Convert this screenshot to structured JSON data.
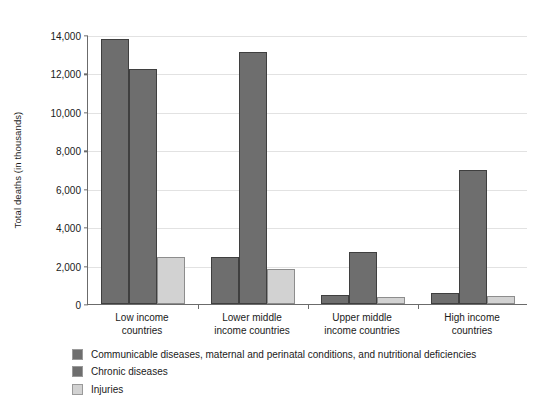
{
  "chart_data": {
    "type": "bar",
    "title": "",
    "xlabel": "",
    "ylabel": "Total deaths (in thousands)",
    "categories": [
      "Low income\ncountries",
      "Lower middle\nincome countries",
      "Upper middle\nincome countries",
      "High income\ncountries"
    ],
    "category_lines": [
      [
        "Low income",
        "countries"
      ],
      [
        "Lower middle",
        "income countries"
      ],
      [
        "Upper middle",
        "income countries"
      ],
      [
        "High income",
        "countries"
      ]
    ],
    "series": [
      {
        "name": "Communicable diseases, maternal and perinatal conditions, and nutritional deficiencies",
        "color": "#6e6e6e",
        "values": [
          13800,
          2450,
          450,
          550
        ]
      },
      {
        "name": "Chronic diseases",
        "color": "#6e6e6e",
        "values": [
          12250,
          13100,
          2700,
          7000
        ]
      },
      {
        "name": "Injuries",
        "color": "#d2d2d2",
        "values": [
          2450,
          1800,
          350,
          400
        ]
      }
    ],
    "ylim": [
      0,
      14000
    ],
    "ytick_values": [
      0,
      2000,
      4000,
      6000,
      8000,
      10000,
      12000,
      14000
    ],
    "ytick_labels": [
      "0",
      "2,000",
      "4,000",
      "6,000",
      "8,000",
      "10,000",
      "12,000",
      "14,000"
    ],
    "grid": true,
    "legend_position": "bottom-left",
    "background_color": "#ffffff",
    "axis_color": "#6b6b6b",
    "gridline_color": "#e2e2e2"
  }
}
